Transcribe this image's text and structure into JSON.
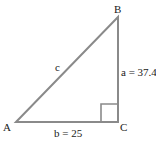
{
  "diagram": {
    "type": "right-triangle",
    "vertices": {
      "A": {
        "label": "A"
      },
      "B": {
        "label": "B"
      },
      "C": {
        "label": "C"
      }
    },
    "sides": {
      "a": {
        "label": "a = 37.4"
      },
      "b": {
        "label": "b = 25"
      },
      "c": {
        "label": "c"
      }
    },
    "right_angle_at": "C",
    "colors": {
      "line": "#8a8a8a",
      "text": "#1a1a1a"
    }
  }
}
